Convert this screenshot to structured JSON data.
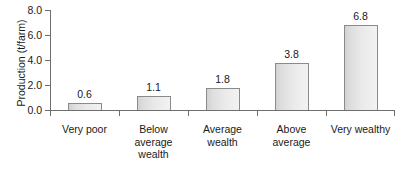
{
  "chart_data": {
    "type": "bar",
    "title": "",
    "xlabel": "",
    "ylabel": "Production (t/farm)",
    "categories": [
      "Very poor",
      "Below average wealth",
      "Average wealth",
      "Above average",
      "Very wealthy"
    ],
    "category_lines": [
      [
        "Very poor"
      ],
      [
        "Below",
        "average",
        "wealth"
      ],
      [
        "Average",
        "wealth"
      ],
      [
        "Above",
        "average"
      ],
      [
        "Very wealthy"
      ]
    ],
    "values": [
      0.6,
      1.1,
      1.8,
      3.8,
      6.8
    ],
    "value_labels": [
      "0.6",
      "1.1",
      "1.8",
      "3.8",
      "6.8"
    ],
    "ylim": [
      0.0,
      8.0
    ],
    "yticks": [
      0.0,
      2.0,
      4.0,
      6.0,
      8.0
    ],
    "ytick_labels": [
      "0.0",
      "2.0",
      "4.0",
      "6.0",
      "8.0"
    ],
    "grid": false,
    "legend": false,
    "bar_fill_color": "#e6e6e6",
    "bar_edge_color": "#8a8a8a",
    "axis_color": "#6e6e6e",
    "text_color": "#1a1a1a"
  }
}
